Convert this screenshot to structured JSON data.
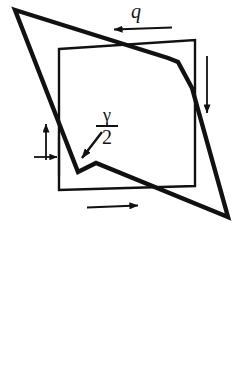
{
  "figure": {
    "name": "shear-deformation-diagram",
    "background_color": "#ffffff",
    "stroke_color": "#111111",
    "width": 241,
    "height": 377
  },
  "labels": {
    "shear_flow": "q",
    "shear_angle_numerator": "γ",
    "shear_angle_denominator": "2",
    "shear_angle_full": "γ/2"
  },
  "shapes": {
    "undeformed_square": {
      "name": "undeformed-square",
      "description": "thin outline square",
      "stroke_width": 2.2,
      "points": "59,49 195,40 195,186 59,190"
    },
    "deformed_outline": {
      "name": "deformed-quadrilateral",
      "description": "thick sheared outline with kinks",
      "stroke_width": 4.2,
      "points": "15,10 178,62 228,217 78,172"
    },
    "deformed_kinks": {
      "name": "deformed-kink-segments",
      "stroke_width": 4.2,
      "upper_right": "178,62 192,88",
      "lower_left": "78,172 96,163"
    }
  },
  "arrows": {
    "top_shear_arrow": {
      "name": "top-shear-arrow",
      "direction": "left",
      "x1": 172,
      "y1": 28,
      "x2": 112,
      "y2": 30
    },
    "right_shear_arrow": {
      "name": "right-shear-arrow",
      "direction": "down",
      "x1": 207,
      "y1": 56,
      "x2": 207,
      "y2": 116
    },
    "bottom_shear_arrow": {
      "name": "bottom-shear-arrow",
      "direction": "right",
      "x1": 87,
      "y1": 207,
      "x2": 141,
      "y2": 205
    },
    "left_shear_arrow": {
      "name": "left-shear-arrow",
      "direction": "up",
      "x1": 46,
      "y1": 160,
      "x2": 46,
      "y2": 121
    },
    "left_small_arrow": {
      "name": "left-offset-arrow",
      "direction": "right",
      "x1": 34,
      "y1": 157,
      "x2": 60,
      "y2": 157
    },
    "gamma_pointer_arrow": {
      "name": "gamma-pointer-arrow",
      "direction": "down-left",
      "x1": 101,
      "y1": 133,
      "x2": 80,
      "y2": 160
    }
  },
  "tick_marks": {
    "left_vertical_tick": {
      "name": "left-vertical-tick",
      "x": 59,
      "y1": 137,
      "y2": 176
    }
  }
}
